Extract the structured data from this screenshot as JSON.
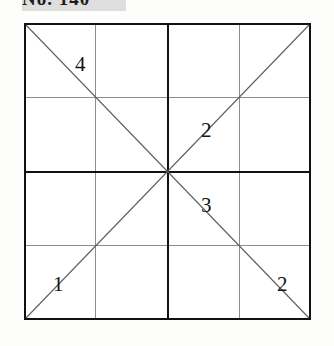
{
  "caption": {
    "text": "No. 140"
  },
  "figure": {
    "grid": {
      "columns": 4,
      "rows": 4,
      "outer_border_color": "#111111",
      "thin_line_color": "#8d8d8d",
      "thick_line_color": "#111111",
      "background": "#ffffff"
    },
    "diagonals": [
      {
        "name": "descending",
        "from": "top-left",
        "to": "bottom-right"
      },
      {
        "name": "ascending",
        "from": "bottom-left",
        "to": "top-right"
      }
    ],
    "labels": [
      {
        "id": "label-upper-left",
        "value": "4",
        "left": 51,
        "top": 31
      },
      {
        "id": "label-upper-right",
        "value": "2",
        "left": 177,
        "top": 97
      },
      {
        "id": "label-lower-right-inner",
        "value": "3",
        "left": 177,
        "top": 172
      },
      {
        "id": "label-lower-left",
        "value": "1",
        "left": 29,
        "top": 251
      },
      {
        "id": "label-bottom-right",
        "value": "2",
        "left": 253,
        "top": 251
      }
    ]
  }
}
